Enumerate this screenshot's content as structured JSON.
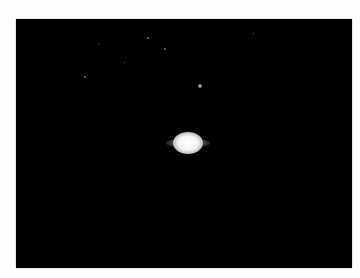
{
  "image": {
    "subject": "Saturn with a moon against a black sky",
    "background_color": "#010101",
    "frame_color": "#fdfdfd"
  }
}
